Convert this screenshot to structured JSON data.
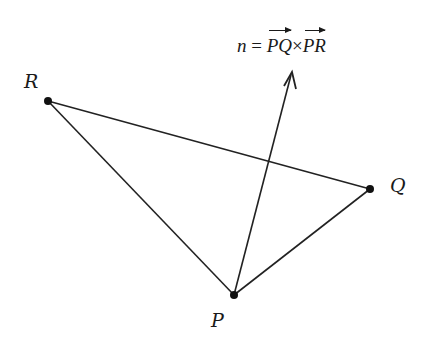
{
  "diagram": {
    "points": [
      {
        "id": "P",
        "label": "P",
        "x": 234,
        "y": 295
      },
      {
        "id": "Q",
        "label": "Q",
        "x": 370,
        "y": 189
      },
      {
        "id": "R",
        "label": "R",
        "x": 48,
        "y": 101
      }
    ],
    "edges": [
      [
        "P",
        "Q"
      ],
      [
        "Q",
        "R"
      ],
      [
        "R",
        "P"
      ]
    ],
    "normal_vector": {
      "from": {
        "x": 234,
        "y": 295
      },
      "to": {
        "x": 292,
        "y": 72
      },
      "formula": {
        "lhs": "n",
        "equals": "=",
        "term1": "PQ",
        "operator": "×",
        "term2": "PR"
      }
    },
    "colors": {
      "stroke": "#222222",
      "background": "#ffffff"
    }
  }
}
